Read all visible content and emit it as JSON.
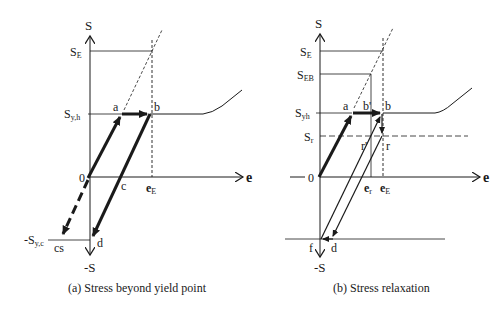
{
  "panel_a": {
    "axis_y_label": "S",
    "axis_y_neg_label": "-S",
    "axis_x_label": "e",
    "origin_label": "0",
    "tick_SE": "S",
    "tick_SE_sub": "E",
    "tick_Syh": "S",
    "tick_Syh_sub": "y,h",
    "tick_Syc": "-S",
    "tick_Syc_sub": "y,c",
    "tick_eE": "e",
    "tick_eE_sub": "E",
    "points": {
      "a": "a",
      "b": "b",
      "c": "c",
      "d": "d",
      "cs": "cs"
    },
    "caption": "(a) Stress beyond yield point"
  },
  "panel_b": {
    "axis_y_label": "S",
    "axis_y_neg_label": "-S",
    "axis_x_label": "e",
    "origin_label": "0",
    "tick_SE": "S",
    "tick_SE_sub": "E",
    "tick_SEB": "S",
    "tick_SEB_sub": "EB",
    "tick_Syh": "S",
    "tick_Syh_sub": "yh",
    "tick_Sr": "S",
    "tick_Sr_sub": "r",
    "tick_er": "e",
    "tick_er_sub": "r",
    "tick_eE": "e",
    "tick_eE_sub": "E",
    "points": {
      "a": "a",
      "b_prime": "b'",
      "b": "b",
      "r_prime": "r'",
      "r": "r",
      "d": "d",
      "f": "f"
    },
    "caption": "(b) Stress relaxation"
  },
  "colors": {
    "line": "#1a1a1a",
    "background": "#ffffff"
  }
}
